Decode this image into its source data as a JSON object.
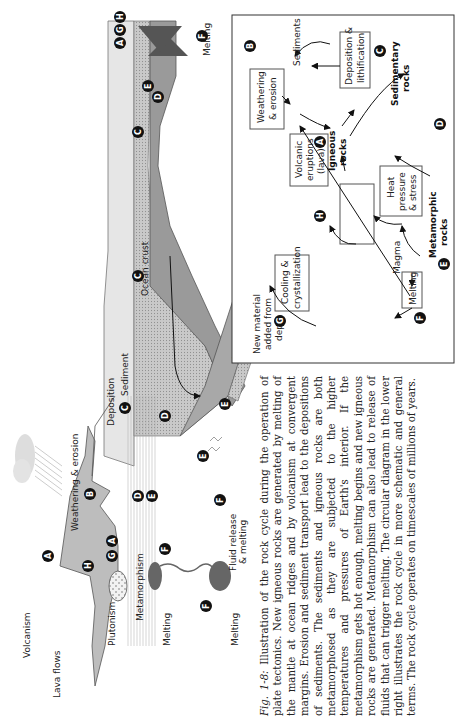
{
  "figure": {
    "caption_prefix": "Fig. 1-8:",
    "caption_text": " Illustration of the rock cycle during the operation of plate tectonics. New igneous rocks are generated by melting of the mantle at ocean ridges and by volcanism at convergent margins. Erosion and sediment transport lead to the depositions of sediments. The sediments and igneous rocks are both metamorphosed as they are subjected to the higher temperatures and pressures of Earth's interior. If the metamorphism gets hot enough, melting begins and new igneous rocks are generated. Metamorphism can also lead to release of fluids that can trigger melting. The circular diagram in the lower right illustrates the rock cycle in more schematic and general terms. The rock cycle operates on timescales of millions of years."
  },
  "tectonic_diagram": {
    "labels": {
      "volcanism": "Volcanism",
      "lava_flows": "Lava flows",
      "plutonism": "Plutonism",
      "weathering_erosion": "Weathering & erosion",
      "deposition": "Deposition",
      "metamorphism_left": "Metamorphism",
      "melting_left": "Melting",
      "melting_lower": "Melting",
      "fluid_release_1": "Fluid release",
      "fluid_release_2": "& melting",
      "sediment": "Sediment",
      "ocean_crust": "Ocean crust",
      "metamorphism_slab": "Metamorphism",
      "melting_ridge": "Melting"
    },
    "badges": [
      "A",
      "B",
      "C",
      "D",
      "E",
      "F",
      "G",
      "H"
    ]
  },
  "cycle_diagram": {
    "nodes": {
      "igneous_1": "Igneous",
      "igneous_2": "rocks",
      "weathering_1": "Weathering",
      "weathering_2": "& erosion",
      "sediments": "Sediments",
      "deposition_1": "Deposition &",
      "deposition_2": "lithification",
      "sedimentary_1": "Sedimentary",
      "sedimentary_2": "rocks",
      "heat_1": "Heat",
      "heat_2": "pressure",
      "heat_3": "& stress",
      "metamorphic_1": "Metamorphic",
      "metamorphic_2": "rocks",
      "melting": "Melting",
      "magma": "Magma",
      "cooling_1": "Cooling &",
      "cooling_2": "crystallization",
      "volcanic_1": "Volcanic",
      "volcanic_2": "eruptions",
      "volcanic_3": "(lava)",
      "new_material_1": "New material",
      "new_material_2": "added from",
      "new_material_3": "depth"
    }
  }
}
